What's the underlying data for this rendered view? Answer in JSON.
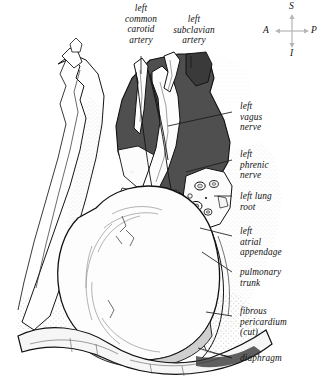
{
  "figure": {
    "ink": "#111111",
    "lung_fill": "#555555",
    "pericardium_fill": "#fdfdfd",
    "stipple": "#9a9a9a",
    "tissue_tint": "#e8e8e8"
  },
  "orientation": {
    "superior": "S",
    "anterior": "A",
    "posterior": "P",
    "inferior": "I",
    "arrow_color": "#b6b6b6"
  },
  "labels": {
    "carotid": "left\ncommon\ncarotid\nartery",
    "subclavian": "left\nsubclavian\nartery",
    "vagus": "left\nvagus\nnerve",
    "phrenic": "left\nphrenic\nnerve",
    "lung_root": "left lung\nroot",
    "atrial_appendage": "left\natrial\nappendage",
    "pulmonary_trunk": "pulmonary\ntrunk",
    "fibrous_pericardium": "fibrous\npericardium\n(cut)",
    "diaphragm": "diaphragm"
  }
}
